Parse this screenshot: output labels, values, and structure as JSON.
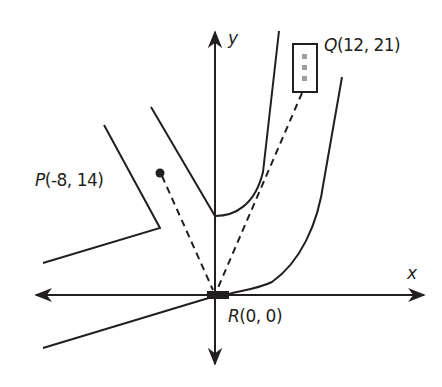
{
  "diagram": {
    "axes": {
      "x_label": "x",
      "y_label": "y"
    },
    "points": {
      "P": {
        "name": "P",
        "coords": "(-8, 14)",
        "label": "P(-8, 14)"
      },
      "Q": {
        "name": "Q",
        "coords": "(12, 21)",
        "label": "Q(12, 21)"
      },
      "R": {
        "name": "R",
        "coords": "(0, 0)",
        "label": "R(0,0)"
      }
    },
    "colors": {
      "stroke": "#231f20",
      "q_dots": "#9e9e9e"
    }
  }
}
